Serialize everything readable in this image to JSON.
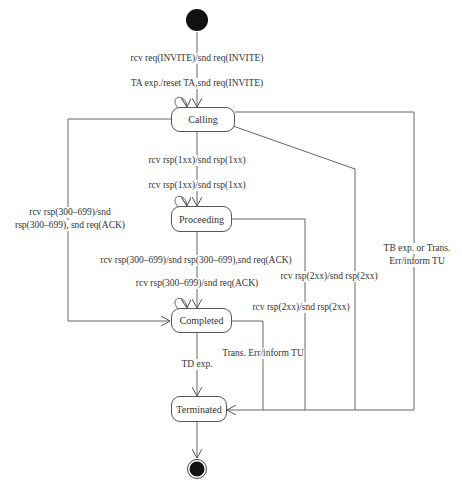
{
  "diagram": {
    "type": "uml-state-machine",
    "states": [
      {
        "id": "calling",
        "label": "Calling"
      },
      {
        "id": "proceeding",
        "label": "Proceeding"
      },
      {
        "id": "completed",
        "label": "Completed"
      },
      {
        "id": "terminated",
        "label": "Terminated"
      }
    ],
    "transitions": {
      "init_to_calling": "rcv req(INVITE)/snd req(INVITE)",
      "calling_self": "TA exp./reset TA,snd req(INVITE)",
      "calling_to_proceeding": "rcv rsp(1xx)/snd rsp(1xx)",
      "proceeding_self": "rcv rsp(1xx)/snd rsp(1xx)",
      "calling_to_completed_line1": "rcv rsp(300–699)/snd",
      "calling_to_completed_line2": "rsp(300–699), snd req(ACK)",
      "proceeding_to_completed": "rcv rsp(300–699)/snd rsp(300–699),snd req(ACK)",
      "completed_self": "rcv rsp(300–699)/snd req(ACK)",
      "calling_to_terminated_2xx": "rcv rsp(2xx)/snd rsp(2xx)",
      "proceeding_to_terminated_2xx": "rcv rsp(2xx)/snd rsp(2xx)",
      "calling_to_terminated_tb_line1": "TB exp. or Trans.",
      "calling_to_terminated_tb_line2": "Err/inform TU",
      "completed_to_terminated_err": "Trans. Err/inform TU",
      "completed_to_terminated_td": "TD exp."
    }
  }
}
